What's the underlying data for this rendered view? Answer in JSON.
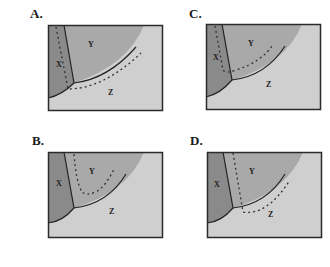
{
  "colors": {
    "region_x": "#8a8a8a",
    "region_y": "#a9a9a9",
    "region_z": "#cfcfcf",
    "outline": "#2a2a2a"
  },
  "panels": [
    {
      "id": "A",
      "label": "A.",
      "regions": {
        "x": "X",
        "y": "Y",
        "z": "Z"
      },
      "dashed_path": "along X/Y boundary inside X, then below Y/Z boundary inside Z"
    },
    {
      "id": "B",
      "label": "B.",
      "regions": {
        "x": "X",
        "y": "Y",
        "z": "Z"
      },
      "dashed_path": "U-shaped curve entirely inside Y"
    },
    {
      "id": "C",
      "label": "C.",
      "regions": {
        "x": "X",
        "y": "Y",
        "z": "Z"
      },
      "dashed_path": "down inside X near X/Y boundary, then up inside Y"
    },
    {
      "id": "D",
      "label": "D.",
      "regions": {
        "x": "X",
        "y": "Y",
        "z": "Z"
      },
      "dashed_path": "down inside Y near X/Y boundary, then along Z below Y/Z boundary"
    }
  ]
}
